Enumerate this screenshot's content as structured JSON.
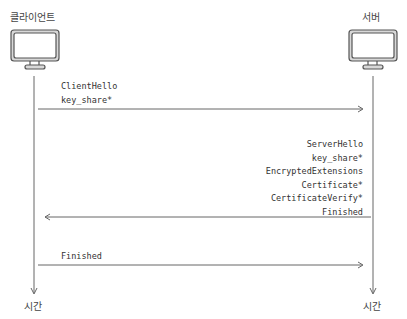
{
  "participants": {
    "client": {
      "label": "클라이언트",
      "icon": "monitor-icon",
      "time_label": "시간"
    },
    "server": {
      "label": "서버",
      "icon": "monitor-icon",
      "time_label": "시간"
    }
  },
  "messages": [
    {
      "direction": "client-to-server",
      "lines": [
        "ClientHello",
        "key_share*"
      ]
    },
    {
      "direction": "server-to-client",
      "lines": [
        "ServerHello",
        "key_share*",
        "EncryptedExtensions",
        "Certificate*",
        "CertificateVerify*",
        "Finished"
      ]
    },
    {
      "direction": "client-to-server",
      "lines": [
        "Finished"
      ]
    }
  ]
}
